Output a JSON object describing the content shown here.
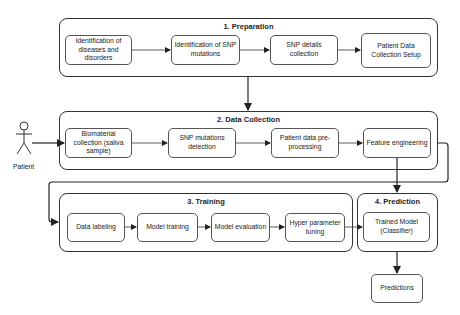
{
  "diagram": {
    "actor": {
      "label": "Patient"
    },
    "groups": [
      {
        "title": "1. Preparation",
        "nodes": [
          "Identification of diseases and disorders",
          "Identification of SNP mutations",
          "SNP details collection",
          "Patient Data Collection Setup"
        ]
      },
      {
        "title": "2. Data Collection",
        "nodes": [
          "Biomaterial collection (saliva sample)",
          "SNP mutations detection",
          "Patient data pre-processing",
          "Feature engineering"
        ]
      },
      {
        "title": "3. Training",
        "nodes": [
          "Data labeling",
          "Model training",
          "Model evaluation",
          "Hyper parameter tuning"
        ]
      },
      {
        "title": "4. Prediction",
        "nodes": [
          "Trained Model (Classifier)"
        ]
      }
    ],
    "output": {
      "label": "Predictions"
    },
    "edges": [
      [
        "Identification of diseases and disorders",
        "Identification of SNP mutations"
      ],
      [
        "Identification of SNP mutations",
        "SNP details collection"
      ],
      [
        "SNP details collection",
        "Patient Data Collection Setup"
      ],
      [
        "1. Preparation",
        "2. Data Collection"
      ],
      [
        "Patient",
        "Biomaterial collection (saliva sample)"
      ],
      [
        "Biomaterial collection (saliva sample)",
        "SNP mutations detection"
      ],
      [
        "SNP mutations detection",
        "Patient data pre-processing"
      ],
      [
        "Patient data pre-processing",
        "Feature engineering"
      ],
      [
        "Feature engineering",
        "4. Prediction"
      ],
      [
        "2. Data Collection",
        "3. Training"
      ],
      [
        "Data labeling",
        "Model training"
      ],
      [
        "Model training",
        "Model evaluation"
      ],
      [
        "Model evaluation",
        "Hyper parameter tuning"
      ],
      [
        "Hyper parameter tuning",
        "Trained Model (Classifier)"
      ],
      [
        "Trained Model (Classifier)",
        "Predictions"
      ]
    ],
    "colors": {
      "stroke": "#333333",
      "node_border": "#555555",
      "background": "#ffffff",
      "text": "#222222"
    }
  }
}
